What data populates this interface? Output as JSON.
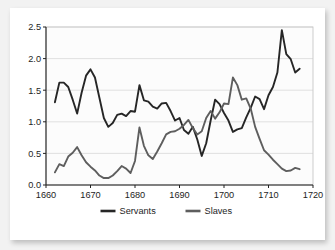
{
  "chart_data": {
    "type": "line",
    "title": "",
    "subtitle": "",
    "xlabel": "",
    "ylabel": "",
    "xlim": [
      1660,
      1720
    ],
    "ylim": [
      0.0,
      2.5
    ],
    "grid": true,
    "legend_position": "bottom",
    "x_ticks": [
      "1660",
      "1670",
      "1680",
      "1690",
      "1700",
      "1710",
      "1720"
    ],
    "x_tick_values": [
      1660,
      1670,
      1680,
      1690,
      1700,
      1710,
      1720
    ],
    "y_ticks": [
      "0.0",
      "0.5",
      "1.0",
      "1.5",
      "2.0",
      "2.5"
    ],
    "y_tick_values": [
      0.0,
      0.5,
      1.0,
      1.5,
      2.0,
      2.5
    ],
    "x": [
      1662,
      1663,
      1664,
      1665,
      1666,
      1667,
      1668,
      1669,
      1670,
      1671,
      1672,
      1673,
      1674,
      1675,
      1676,
      1677,
      1678,
      1679,
      1680,
      1681,
      1682,
      1683,
      1684,
      1685,
      1686,
      1687,
      1688,
      1689,
      1690,
      1691,
      1692,
      1693,
      1694,
      1695,
      1696,
      1697,
      1698,
      1699,
      1700,
      1701,
      1702,
      1703,
      1704,
      1705,
      1706,
      1707,
      1708,
      1709,
      1710,
      1711,
      1712,
      1713,
      1714,
      1715,
      1716,
      1717
    ],
    "series": [
      {
        "name": "Servants",
        "color": "#262626",
        "values": [
          1.31,
          1.62,
          1.62,
          1.55,
          1.35,
          1.13,
          1.46,
          1.73,
          1.83,
          1.7,
          1.38,
          1.06,
          0.92,
          0.98,
          1.11,
          1.13,
          1.09,
          1.17,
          1.16,
          1.58,
          1.34,
          1.32,
          1.24,
          1.21,
          1.29,
          1.3,
          1.17,
          1.02,
          1.06,
          0.87,
          0.81,
          0.92,
          0.72,
          0.46,
          0.66,
          1.02,
          1.35,
          1.28,
          1.14,
          1.02,
          0.84,
          0.88,
          0.9,
          1.07,
          1.22,
          1.4,
          1.36,
          1.2,
          1.42,
          1.55,
          1.78,
          2.45,
          2.07,
          1.99,
          1.78,
          1.84
        ]
      },
      {
        "name": "Slaves",
        "color": "#5e5e5e",
        "values": [
          0.2,
          0.33,
          0.3,
          0.45,
          0.51,
          0.6,
          0.47,
          0.36,
          0.29,
          0.23,
          0.15,
          0.11,
          0.11,
          0.15,
          0.22,
          0.3,
          0.26,
          0.19,
          0.38,
          0.91,
          0.62,
          0.47,
          0.41,
          0.53,
          0.66,
          0.8,
          0.84,
          0.85,
          0.89,
          0.95,
          1.03,
          0.9,
          0.8,
          0.85,
          1.06,
          1.17,
          1.05,
          1.15,
          1.29,
          1.28,
          1.7,
          1.58,
          1.35,
          1.37,
          1.21,
          0.92,
          0.73,
          0.55,
          0.48,
          0.4,
          0.33,
          0.26,
          0.22,
          0.23,
          0.27,
          0.25
        ]
      }
    ],
    "legend": [
      {
        "label": "Servants",
        "color": "#262626"
      },
      {
        "label": "Slaves",
        "color": "#5e5e5e"
      }
    ],
    "colors": {
      "servants": "#262626",
      "slaves": "#5e5e5e",
      "plot_background": "#fcfcfc",
      "gridline": "#d9d9d9",
      "axis": "#222222",
      "card_background": "#ffffff",
      "page_background": "#f2f2f2"
    }
  }
}
